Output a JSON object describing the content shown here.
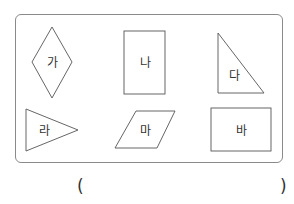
{
  "figure": {
    "shapes": [
      {
        "id": "ga",
        "label": "가",
        "type": "rhombus"
      },
      {
        "id": "na",
        "label": "나",
        "type": "rectangle"
      },
      {
        "id": "da",
        "label": "다",
        "type": "right-triangle"
      },
      {
        "id": "ra",
        "label": "라",
        "type": "triangle"
      },
      {
        "id": "ma",
        "label": "마",
        "type": "parallelogram"
      },
      {
        "id": "ba",
        "label": "바",
        "type": "rectangle"
      }
    ],
    "stroke_color": "#555555",
    "border_color": "#8a8a8a"
  },
  "answer": {
    "open_paren": "(",
    "close_paren": ")",
    "value": ""
  }
}
